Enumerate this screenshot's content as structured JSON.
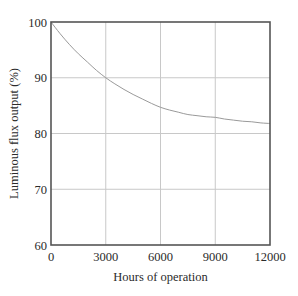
{
  "chart_data": {
    "type": "line",
    "title": "",
    "xlabel": "Hours of operation",
    "ylabel": "Luminous flux output (%)",
    "xlim": [
      0,
      12000
    ],
    "ylim": [
      60,
      100
    ],
    "grid": true,
    "legend": null,
    "legend_position": "none",
    "x_ticks": [
      0,
      3000,
      6000,
      9000,
      12000
    ],
    "x_tick_labels": [
      "0",
      "3000",
      "6000",
      "9000",
      "12000"
    ],
    "y_ticks": [
      60,
      70,
      80,
      90,
      100
    ],
    "y_tick_labels": [
      "60",
      "70",
      "80",
      "90",
      "100"
    ],
    "series": [
      {
        "name": "Luminous flux output",
        "color": "#9a9a9a",
        "x": [
          0,
          500,
          1000,
          1500,
          2000,
          2500,
          3000,
          3500,
          4000,
          4500,
          5000,
          5500,
          6000,
          6500,
          7000,
          7500,
          8000,
          8500,
          9000,
          9500,
          10000,
          10500,
          11000,
          11500,
          12000
        ],
        "values": [
          100.0,
          97.9,
          96.0,
          94.3,
          92.8,
          91.3,
          90.0,
          88.9,
          87.9,
          87.0,
          86.2,
          85.4,
          84.7,
          84.2,
          83.8,
          83.4,
          83.2,
          83.0,
          82.9,
          82.6,
          82.4,
          82.2,
          82.1,
          81.9,
          81.8
        ]
      }
    ],
    "annotations": []
  },
  "style": {
    "frame_color": "#555555",
    "grid_color": "#c8c8c8",
    "background": "#ffffff",
    "text_color": "#2b2b2b"
  }
}
